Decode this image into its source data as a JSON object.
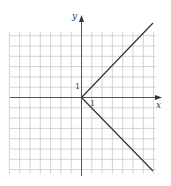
{
  "chart_data": {
    "type": "line",
    "title": "",
    "xlabel": "x",
    "ylabel": "y",
    "tick_labels": {
      "x": "1",
      "y": "1"
    },
    "grid": true,
    "xlim": [
      -7,
      7
    ],
    "ylim": [
      -7,
      6
    ],
    "series": [
      {
        "name": "upper branch (y = x, x ≥ 0)",
        "x": [
          0,
          7
        ],
        "y": [
          0,
          7
        ]
      },
      {
        "name": "lower branch (y = -x, x ≥ 0)",
        "x": [
          0,
          7
        ],
        "y": [
          0,
          -7
        ]
      }
    ],
    "relation": "x = |y|",
    "colors": {
      "grid": "#c8c8c8",
      "axes": "#555555",
      "curve": "#333333"
    }
  }
}
